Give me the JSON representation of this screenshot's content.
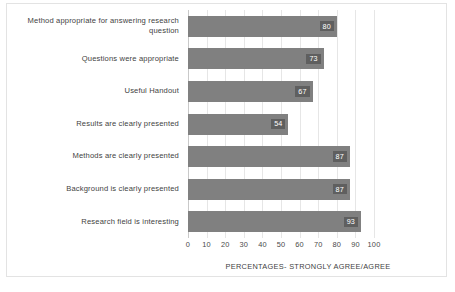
{
  "chart_data": {
    "type": "bar",
    "orientation": "horizontal",
    "title": "",
    "xlabel": "PERCENTAGES- STRONGLY AGREE/AGREE",
    "ylabel": "",
    "xlim": [
      0,
      100
    ],
    "xticks": [
      0,
      10,
      20,
      30,
      40,
      50,
      60,
      70,
      80,
      90,
      100
    ],
    "grid": true,
    "legend": null,
    "bar_color": "#808080",
    "label_box_color": "#5f5f5f",
    "label_text_color": "#ffffff",
    "categories": [
      "Method appropriate for answering research question",
      "Questions were appropriate",
      "Useful Handout",
      "Results are clearly presented",
      "Methods are clearly presented",
      "Background is clearly presented",
      "Research field is interesting"
    ],
    "values": [
      80,
      73,
      67,
      54,
      87,
      87,
      93
    ],
    "bars": [
      {
        "category_line1": "Method appropriate for answering research",
        "category_line2": "question",
        "value": 80,
        "value_text": "80"
      },
      {
        "category_line1": "Questions were appropriate",
        "category_line2": "",
        "value": 73,
        "value_text": "73"
      },
      {
        "category_line1": "Useful Handout",
        "category_line2": "",
        "value": 67,
        "value_text": "67"
      },
      {
        "category_line1": "Results are clearly presented",
        "category_line2": "",
        "value": 54,
        "value_text": "54"
      },
      {
        "category_line1": "Methods are clearly presented",
        "category_line2": "",
        "value": 87,
        "value_text": "87"
      },
      {
        "category_line1": "Background is clearly presented",
        "category_line2": "",
        "value": 87,
        "value_text": "87"
      },
      {
        "category_line1": "Research field is interesting",
        "category_line2": "",
        "value": 93,
        "value_text": "93"
      }
    ]
  },
  "axis": {
    "tick_0": "0",
    "tick_1": "10",
    "tick_2": "20",
    "tick_3": "30",
    "tick_4": "40",
    "tick_5": "50",
    "tick_6": "60",
    "tick_7": "70",
    "tick_8": "80",
    "tick_9": "90",
    "tick_10": "100"
  },
  "labels": {
    "cat_0_line1": "Method appropriate for answering research",
    "cat_0_line2": "question",
    "cat_1": "Questions were appropriate",
    "cat_2": "Useful Handout",
    "cat_3": "Results are clearly presented",
    "cat_4": "Methods are clearly presented",
    "cat_5": "Background is clearly presented",
    "cat_6": "Research field is interesting",
    "value_0": "80",
    "value_1": "73",
    "value_2": "67",
    "value_3": "54",
    "value_4": "87",
    "value_5": "87",
    "value_6": "93",
    "xaxis_title": "PERCENTAGES- STRONGLY AGREE/AGREE"
  }
}
